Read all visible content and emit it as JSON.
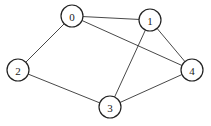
{
  "graph": {
    "type": "undirected",
    "nodes": [
      {
        "id": "0",
        "label": "0",
        "x": 72,
        "y": 16
      },
      {
        "id": "1",
        "label": "1",
        "x": 150,
        "y": 20
      },
      {
        "id": "2",
        "label": "2",
        "x": 18,
        "y": 70
      },
      {
        "id": "3",
        "label": "3",
        "x": 110,
        "y": 107
      },
      {
        "id": "4",
        "label": "4",
        "x": 192,
        "y": 70
      }
    ],
    "edges": [
      {
        "from": "0",
        "to": "1"
      },
      {
        "from": "0",
        "to": "2"
      },
      {
        "from": "0",
        "to": "4"
      },
      {
        "from": "1",
        "to": "3"
      },
      {
        "from": "1",
        "to": "4"
      },
      {
        "from": "2",
        "to": "3"
      },
      {
        "from": "3",
        "to": "4"
      }
    ],
    "node_radius": 11,
    "colors": {
      "stroke": "#222222",
      "fill": "#ffffff",
      "edge": "#333333"
    }
  }
}
